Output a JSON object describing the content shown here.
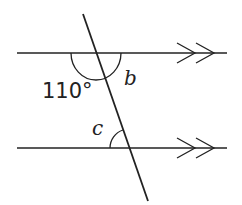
{
  "diagram": {
    "type": "parallel-lines-transversal",
    "labels": {
      "angle_given": "110°",
      "angle_b": "b",
      "angle_c": "c"
    },
    "colors": {
      "line": "#222222",
      "background": "#ffffff"
    }
  }
}
